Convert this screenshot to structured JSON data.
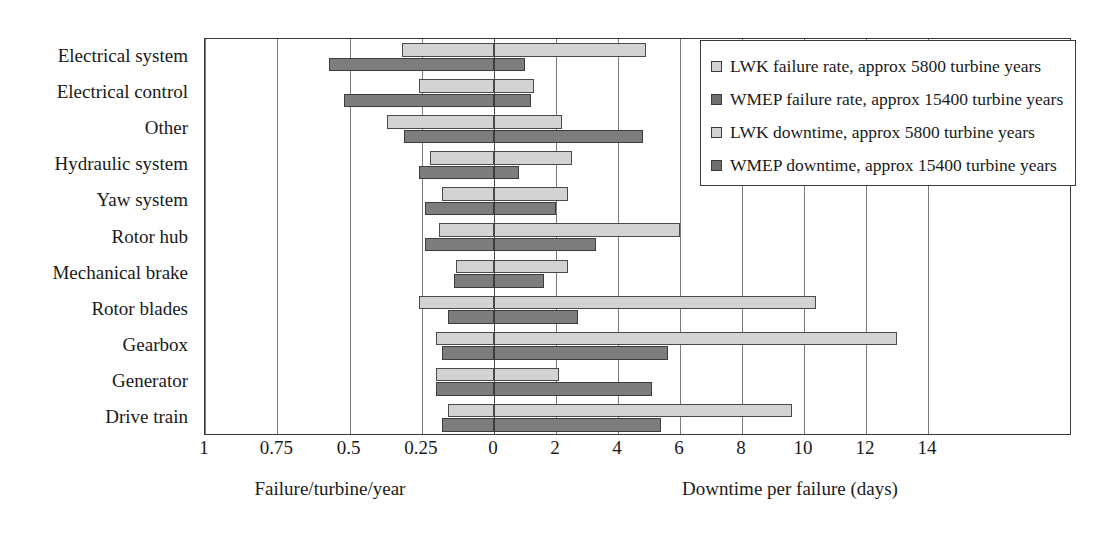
{
  "chart_data": {
    "type": "bar",
    "title": "",
    "orientation": "horizontal",
    "layout": "bidirectional butterfly chart: failure rate extends left from centre, downtime extends right from centre",
    "categories": [
      "Electrical system",
      "Electrical control",
      "Other",
      "Hydraulic system",
      "Yaw system",
      "Rotor hub",
      "Mechanical brake",
      "Rotor blades",
      "Gearbox",
      "Generator",
      "Drive train"
    ],
    "left_axis": {
      "label": "Failure/turbine/year",
      "ticks": [
        "1",
        "0.75",
        "0.5",
        "0.25",
        "0"
      ],
      "tick_values": [
        1,
        0.75,
        0.5,
        0.25,
        0
      ],
      "range": [
        1,
        0
      ],
      "direction": "right-to-left"
    },
    "right_axis": {
      "label": "Downtime per failure (days)",
      "ticks": [
        "0",
        "2",
        "4",
        "6",
        "8",
        "10",
        "12",
        "14"
      ],
      "tick_values": [
        0,
        2,
        4,
        6,
        8,
        10,
        12,
        14
      ],
      "range": [
        0,
        14
      ],
      "direction": "left-to-right"
    },
    "grid": true,
    "legend_position": "top-right",
    "series": [
      {
        "name": "LWK failure rate, approx 5800 turbine years",
        "axis": "left",
        "style": "light",
        "values": [
          0.32,
          0.26,
          0.37,
          0.22,
          0.18,
          0.19,
          0.13,
          0.26,
          0.2,
          0.2,
          0.16
        ]
      },
      {
        "name": "WMEP failure rate, approx 15400 turbine years",
        "axis": "left",
        "style": "dark",
        "values": [
          0.57,
          0.52,
          0.31,
          0.26,
          0.24,
          0.24,
          0.14,
          0.16,
          0.18,
          0.2,
          0.18
        ]
      },
      {
        "name": "LWK downtime, approx 5800 turbine years",
        "axis": "right",
        "style": "light",
        "values": [
          4.9,
          1.3,
          2.2,
          2.5,
          2.4,
          6.0,
          2.4,
          10.4,
          13.0,
          2.1,
          9.6
        ]
      },
      {
        "name": "WMEP downtime, approx 15400 turbine years",
        "axis": "right",
        "style": "dark",
        "values": [
          1.0,
          1.2,
          4.8,
          0.8,
          2.0,
          3.3,
          1.6,
          2.7,
          5.6,
          5.1,
          5.4
        ]
      }
    ]
  },
  "legend": {
    "items": [
      {
        "swatch": "lwk",
        "label": "LWK failure rate, approx 5800 turbine years"
      },
      {
        "swatch": "wmep",
        "label": "WMEP failure rate, approx 15400 turbine years"
      },
      {
        "swatch": "lwk",
        "label": "LWK downtime, approx 5800 turbine years"
      },
      {
        "swatch": "wmep",
        "label": "WMEP downtime, approx 15400 turbine years"
      }
    ]
  },
  "colors": {
    "light_fill": "#d3d3d3",
    "dark_fill": "#7d7d7d",
    "outline": "#3a3a3a",
    "grid": "#7a7a7a",
    "background": "#ffffff"
  }
}
